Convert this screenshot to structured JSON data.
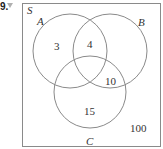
{
  "question": {
    "number": "9.",
    "marker": "dropdown-triangle"
  },
  "venn": {
    "universe_label": "S",
    "sets": [
      {
        "label": "A",
        "cx": 70,
        "cy": 51,
        "r": 37
      },
      {
        "label": "B",
        "cx": 110,
        "cy": 51,
        "r": 37
      },
      {
        "label": "C",
        "cx": 90,
        "cy": 92,
        "r": 36
      }
    ],
    "regions": {
      "A_only": "3",
      "A_and_B": "4",
      "B_and_C": "10",
      "C_only": "15",
      "outside": "100"
    },
    "colors": {
      "stroke": "#8a8a8a",
      "text": "#333333"
    }
  }
}
